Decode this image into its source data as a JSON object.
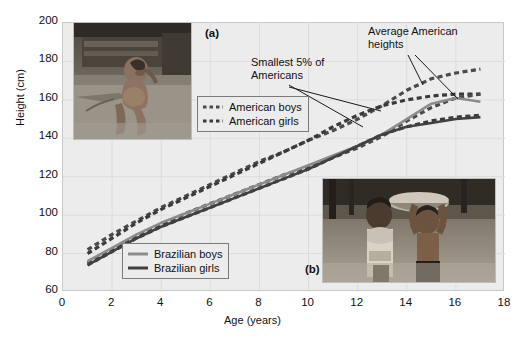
{
  "figure": {
    "panel_a_tag": "(a)",
    "panel_b_tag": "(b)",
    "photo_a_alt": "photo-malnourished-child",
    "photo_b_alt": "photo-two-children-carrying-basin"
  },
  "annotations": {
    "average": "Average American heights",
    "smallest": "Smallest 5% of Americans"
  },
  "legend_american": {
    "items": [
      {
        "label": "American boys",
        "style": "dashed",
        "color": "#4a4a4a"
      },
      {
        "label": "American girls",
        "style": "dashed",
        "color": "#3a3a3a"
      }
    ]
  },
  "legend_brazilian": {
    "items": [
      {
        "label": "Brazilian boys",
        "style": "solid",
        "color": "#8c8c8c"
      },
      {
        "label": "Brazilian girls",
        "style": "solid",
        "color": "#404040"
      }
    ]
  },
  "chart_data": {
    "type": "line",
    "title": "",
    "xlabel": "Age (years)",
    "ylabel": "Height (cm)",
    "xlim": [
      0,
      18
    ],
    "ylim": [
      60,
      200
    ],
    "xticks": [
      0,
      2,
      4,
      6,
      8,
      10,
      12,
      14,
      16,
      18
    ],
    "yticks": [
      60,
      80,
      100,
      120,
      140,
      160,
      180,
      200
    ],
    "grid": true,
    "legend_position": "inside",
    "x": [
      1,
      2,
      3,
      4,
      5,
      6,
      7,
      8,
      9,
      10,
      11,
      12,
      13,
      14,
      15,
      16,
      17
    ],
    "series": [
      {
        "name": "American boys",
        "group": "Average American heights",
        "style": "dashed",
        "color": "#4a4a4a",
        "values": [
          82,
          90,
          97,
          104,
          110,
          116,
          122,
          128,
          133,
          139,
          144,
          150,
          157,
          165,
          171,
          174,
          176
        ]
      },
      {
        "name": "American girls",
        "group": "Average American heights",
        "style": "dashed",
        "color": "#3a3a3a",
        "values": [
          80,
          88,
          96,
          103,
          109,
          115,
          121,
          127,
          133,
          139,
          146,
          152,
          157,
          160,
          162,
          163,
          163
        ]
      },
      {
        "name": "American boys 5th percentile",
        "group": "Smallest 5% of Americans",
        "style": "dashed",
        "color": "#4a4a4a",
        "values": [
          75,
          82,
          89,
          95,
          101,
          106,
          111,
          116,
          121,
          125,
          130,
          135,
          141,
          149,
          156,
          161,
          163
        ]
      },
      {
        "name": "American girls 5th percentile",
        "group": "Smallest 5% of Americans",
        "style": "dashed",
        "color": "#3a3a3a",
        "values": [
          74,
          81,
          88,
          94,
          99,
          104,
          109,
          114,
          119,
          124,
          130,
          136,
          142,
          146,
          149,
          151,
          152
        ]
      },
      {
        "name": "Brazilian boys",
        "style": "solid",
        "color": "#8c8c8c",
        "values": [
          76,
          83,
          90,
          96,
          101,
          106,
          111,
          116,
          121,
          126,
          131,
          136,
          142,
          150,
          158,
          161,
          159
        ]
      },
      {
        "name": "Brazilian girls",
        "style": "solid",
        "color": "#404040",
        "values": [
          74,
          81,
          88,
          94,
          99,
          104,
          109,
          114,
          119,
          124,
          130,
          136,
          142,
          146,
          148,
          150,
          151
        ]
      }
    ]
  }
}
